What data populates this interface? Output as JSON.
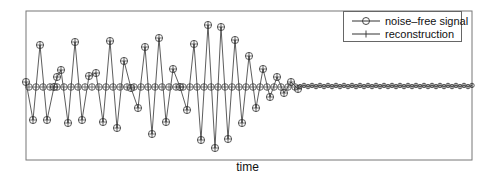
{
  "chart_data": {
    "type": "line",
    "title": "",
    "xlabel": "time",
    "ylabel": "",
    "grid": false,
    "legend_position": "upper right",
    "ylim": [
      -1.0,
      1.0
    ],
    "series": [
      {
        "name": "noise–free signal",
        "marker": "circle",
        "color": "#333333"
      },
      {
        "name": "reconstruction",
        "marker": "plus",
        "color": "#333333"
      }
    ],
    "samples_pixel_y": [
      {
        "x": 26,
        "y": 82
      },
      {
        "x": 33,
        "y": 120
      },
      {
        "x": 40,
        "y": 45
      },
      {
        "x": 47,
        "y": 120
      },
      {
        "x": 54,
        "y": 87
      },
      {
        "x": 57,
        "y": 77
      },
      {
        "x": 61,
        "y": 70
      },
      {
        "x": 68,
        "y": 123
      },
      {
        "x": 75,
        "y": 42
      },
      {
        "x": 82,
        "y": 120
      },
      {
        "x": 89,
        "y": 76
      },
      {
        "x": 96,
        "y": 73
      },
      {
        "x": 103,
        "y": 122
      },
      {
        "x": 110,
        "y": 41
      },
      {
        "x": 117,
        "y": 128
      },
      {
        "x": 124,
        "y": 61
      },
      {
        "x": 131,
        "y": 88
      },
      {
        "x": 138,
        "y": 108
      },
      {
        "x": 145,
        "y": 47
      },
      {
        "x": 152,
        "y": 134
      },
      {
        "x": 159,
        "y": 38
      },
      {
        "x": 166,
        "y": 122
      },
      {
        "x": 173,
        "y": 69
      },
      {
        "x": 180,
        "y": 87
      },
      {
        "x": 187,
        "y": 110
      },
      {
        "x": 194,
        "y": 44
      },
      {
        "x": 201,
        "y": 140
      },
      {
        "x": 208,
        "y": 25
      },
      {
        "x": 215,
        "y": 148
      },
      {
        "x": 221,
        "y": 27
      },
      {
        "x": 228,
        "y": 139
      },
      {
        "x": 235,
        "y": 40
      },
      {
        "x": 242,
        "y": 123
      },
      {
        "x": 249,
        "y": 56
      },
      {
        "x": 256,
        "y": 108
      },
      {
        "x": 263,
        "y": 69
      },
      {
        "x": 270,
        "y": 97
      },
      {
        "x": 277,
        "y": 77
      },
      {
        "x": 284,
        "y": 93
      },
      {
        "x": 291,
        "y": 82
      },
      {
        "x": 298,
        "y": 89
      }
    ],
    "baseline_pixel_y": 87,
    "dense_tail": {
      "x_start": 300,
      "x_end": 472,
      "spacing": 4,
      "y": 86
    },
    "baseline_markers_spacing": 7
  },
  "legend": {
    "items": [
      {
        "label": "noise–free signal"
      },
      {
        "label": "reconstruction"
      }
    ]
  },
  "axes": {
    "xlabel": "time"
  }
}
